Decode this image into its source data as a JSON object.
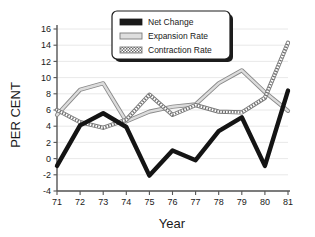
{
  "chart_data": {
    "type": "line",
    "title": "",
    "xlabel": "Year",
    "ylabel": "PER CENT",
    "x": [
      71,
      72,
      73,
      74,
      75,
      76,
      77,
      78,
      79,
      80,
      81
    ],
    "xtick_labels": [
      "71",
      "72",
      "73",
      "74",
      "75",
      "76",
      "77",
      "78",
      "79",
      "80",
      "81"
    ],
    "ytick_labels": [
      "-4",
      "-2",
      "0",
      "2",
      "4",
      "6",
      "8",
      "10",
      "12",
      "14",
      "16"
    ],
    "ylim": [
      -4,
      16
    ],
    "xlim": [
      71,
      81
    ],
    "grid": true,
    "legend_position": "top-center",
    "series": [
      {
        "name": "Net Change",
        "style": "thick-solid-black",
        "color": "#1a1a1a",
        "values": [
          -0.9,
          4.1,
          5.6,
          3.9,
          -2.1,
          1.0,
          -0.2,
          3.4,
          5.1,
          -0.9,
          8.4
        ]
      },
      {
        "name": "Expansion Rate",
        "style": "light-gray-solid",
        "color": "#b4b4b4",
        "values": [
          5.4,
          8.5,
          9.3,
          4.6,
          5.8,
          6.4,
          6.7,
          9.3,
          10.9,
          8.2,
          5.9
        ]
      },
      {
        "name": "Contraction Rate",
        "style": "gray-dotted-hatch",
        "color": "#8c8c8c",
        "values": [
          6.0,
          4.5,
          3.8,
          4.8,
          7.9,
          5.4,
          6.6,
          5.8,
          5.7,
          7.5,
          14.3
        ]
      }
    ]
  },
  "legend": {
    "entries": [
      {
        "label": "Net Change",
        "swatch": "solid-dark"
      },
      {
        "label": "Expansion Rate",
        "swatch": "solid-light"
      },
      {
        "label": "Contraction Rate",
        "swatch": "dotted"
      }
    ]
  },
  "axes": {
    "x_title": "Year",
    "y_title": "PER CENT"
  }
}
